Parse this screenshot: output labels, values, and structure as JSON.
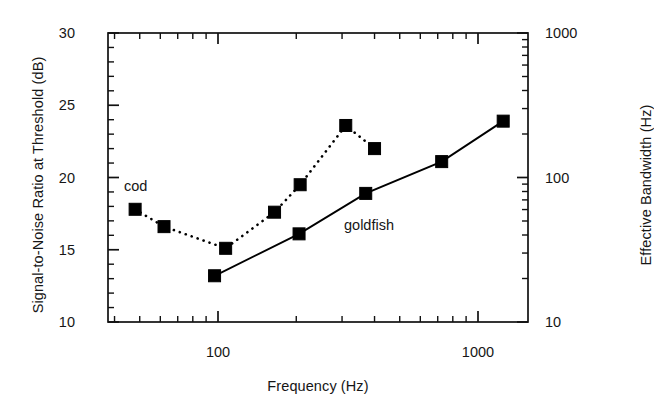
{
  "chart_data": {
    "type": "line",
    "title": "",
    "xlabel": "Frequency (Hz)",
    "ylabel": "Signal-to-Noise Ratio at Threshold (dB)",
    "y2label": "Effective Bandwidth (Hz)",
    "xscale": "log",
    "yscale": "linear",
    "y2scale": "log",
    "xlim": [
      50,
      2000
    ],
    "ylim": [
      10,
      30
    ],
    "y2lim": [
      10,
      1000
    ],
    "grid": false,
    "legend_position": "inline-annotations",
    "xticks": [
      {
        "value": 100,
        "label": "100",
        "major": true
      },
      {
        "value": 1000,
        "label": "1000",
        "major": true
      }
    ],
    "yticks": [
      {
        "value": 10,
        "label": "10"
      },
      {
        "value": 15,
        "label": "15"
      },
      {
        "value": 20,
        "label": "20"
      },
      {
        "value": 25,
        "label": "25"
      },
      {
        "value": 30,
        "label": "30"
      }
    ],
    "y2ticks": [
      {
        "value": 10,
        "label": "10"
      },
      {
        "value": 100,
        "label": "100"
      },
      {
        "value": 1000,
        "label": "1000"
      }
    ],
    "series": [
      {
        "name": "cod",
        "marker": "filled-square",
        "linestyle": "dotted",
        "color": "#000000",
        "x": [
          48,
          62,
          107,
          165,
          207,
          310,
          400
        ],
        "y": [
          17.8,
          16.6,
          15.1,
          17.6,
          19.5,
          23.6,
          22.0
        ]
      },
      {
        "name": "goldfish",
        "marker": "filled-square",
        "linestyle": "solid",
        "color": "#000000",
        "x": [
          97,
          205,
          370,
          725,
          1250
        ],
        "y": [
          13.2,
          16.1,
          18.9,
          21.1,
          23.9
        ]
      }
    ],
    "annotations": [
      {
        "text": "cod",
        "x_px": 124,
        "y_px": 178
      },
      {
        "text": "goldfish",
        "x_px": 344,
        "y_px": 217
      }
    ]
  }
}
